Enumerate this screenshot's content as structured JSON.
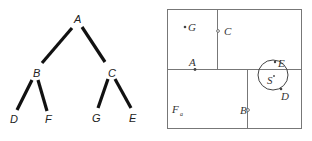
{
  "tree": {
    "nodes": [
      {
        "id": "A",
        "label": "A"
      },
      {
        "id": "B",
        "label": "B"
      },
      {
        "id": "C",
        "label": "C"
      },
      {
        "id": "D",
        "label": "D"
      },
      {
        "id": "F",
        "label": "F"
      },
      {
        "id": "G",
        "label": "G"
      },
      {
        "id": "E",
        "label": "E"
      }
    ],
    "edges": [
      {
        "from": "A",
        "to": "B"
      },
      {
        "from": "A",
        "to": "C"
      },
      {
        "from": "B",
        "to": "D"
      },
      {
        "from": "B",
        "to": "F"
      },
      {
        "from": "C",
        "to": "G"
      },
      {
        "from": "C",
        "to": "E"
      }
    ]
  },
  "partition": {
    "points": [
      {
        "id": "G",
        "label": "G",
        "marker": "dot"
      },
      {
        "id": "C",
        "label": "C",
        "marker": "hollow"
      },
      {
        "id": "A",
        "label": "A",
        "marker": "dot"
      },
      {
        "id": "E",
        "label": "E",
        "marker": "dot"
      },
      {
        "id": "S",
        "label": "S",
        "marker": "dot"
      },
      {
        "id": "D",
        "label": "D",
        "marker": "dot"
      },
      {
        "id": "B",
        "label": "B",
        "marker": "hollow"
      },
      {
        "id": "F",
        "label": "F",
        "subscript": "a",
        "marker": "none"
      }
    ],
    "query_circle": {
      "center": "S",
      "contains": [
        "E",
        "D"
      ]
    }
  }
}
